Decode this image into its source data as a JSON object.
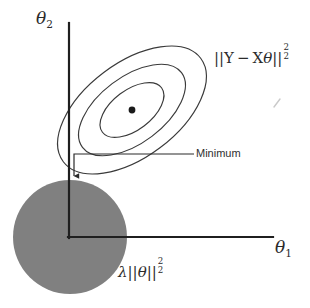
{
  "figure": {
    "kind": "diagram",
    "title_hidden": "Ridge regression: squared-error contours meeting the L2 penalty ball",
    "background_color": "#ffffff",
    "ink_color": "#2b2b2b",
    "contour_color": "#3a3a3a",
    "ball_fill_color": "#808080"
  },
  "axes": {
    "vertical": {
      "label_base": "θ",
      "label_sub": "2",
      "name": "theta-2",
      "x": 69,
      "y_top": 23,
      "y_bottom": 238,
      "width": 2.2
    },
    "horizontal": {
      "label_base": "θ",
      "label_sub": "1",
      "name": "theta-1",
      "y": 237,
      "x_left": 69,
      "x_right": 273,
      "width": 2.2
    },
    "origin": {
      "x": 69,
      "y": 237
    }
  },
  "penalty_ball": {
    "label_lambda": "λ",
    "label_norm_open": "||",
    "label_theta": "θ",
    "label_norm_close": "||",
    "label_sup": "2",
    "label_sub": "2",
    "center_x": 70,
    "center_y": 237,
    "radius": 57,
    "fill": "#808080"
  },
  "loss_contours": {
    "label_norm_open": "||",
    "label_y": "Y",
    "label_minus": "−",
    "label_x": "X",
    "label_theta": "θ",
    "label_norm_close": "||",
    "label_sup": "2",
    "label_sub": "2",
    "center_x": 132,
    "center_y": 110,
    "rotation_deg": -37,
    "rings": [
      {
        "name": "outer-contour",
        "rx": 86,
        "ry": 47
      },
      {
        "name": "middle-contour",
        "rx": 62,
        "ry": 33
      },
      {
        "name": "inner-contour",
        "rx": 37,
        "ry": 20
      }
    ],
    "center_dot": {
      "x": 132,
      "y": 110,
      "r": 3.4,
      "name": "contour-center-dot"
    }
  },
  "minimum_annotation": {
    "text": "Minimum",
    "leader": {
      "x_right": 194,
      "y": 154,
      "x_corner": 74,
      "y_arrow_tip": 182
    },
    "point": {
      "x": 74,
      "y": 182
    }
  },
  "stray_mark": {
    "name": "scan-artifact-tick",
    "x": 277,
    "y": 103
  }
}
